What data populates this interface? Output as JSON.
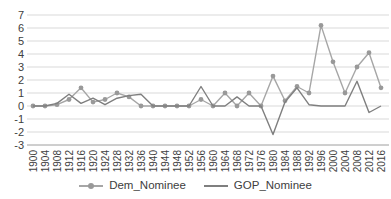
{
  "chart_data": {
    "type": "line",
    "title": "",
    "xlabel": "",
    "ylabel": "",
    "ylim": [
      -3,
      7
    ],
    "ytick_step": 1,
    "grid": true,
    "legend_position": "bottom",
    "gridline_color": "#d9d9d9",
    "axis_line_color": "#9e9e9e",
    "tick_label_color": "#404040",
    "categories": [
      "1900",
      "1904",
      "1908",
      "1912",
      "1916",
      "1920",
      "1924",
      "1928",
      "1932",
      "1936",
      "1940",
      "1944",
      "1948",
      "1952",
      "1956",
      "1960",
      "1964",
      "1968",
      "1972",
      "1976",
      "1980",
      "1984",
      "1988",
      "1992",
      "1996",
      "2000",
      "2004",
      "2008",
      "2012",
      "2016"
    ],
    "series": [
      {
        "name": "Dem_Nominee",
        "color": "#a6a6a6",
        "marker": "circle",
        "marker_color": "#999999",
        "values": [
          0,
          0,
          0.1,
          0.5,
          1.4,
          0.3,
          0.5,
          1.0,
          0.7,
          0,
          0,
          0,
          0,
          0,
          0.5,
          0,
          1.0,
          0,
          1.0,
          0,
          2.3,
          0.4,
          1.5,
          1.0,
          6.2,
          3.4,
          1.0,
          3.0,
          4.1,
          1.4
        ]
      },
      {
        "name": "GOP_Nominee",
        "color": "#7f7f7f",
        "marker": "none",
        "marker_color": "#7f7f7f",
        "values": [
          0,
          0,
          0.2,
          0.9,
          0.2,
          0.6,
          0.1,
          0.6,
          0.8,
          0.9,
          0,
          0,
          0,
          0,
          1.5,
          0,
          0,
          0.7,
          0,
          0,
          -2.2,
          0.3,
          1.4,
          0.1,
          0,
          0,
          0,
          1.9,
          -0.5,
          0
        ]
      }
    ]
  }
}
